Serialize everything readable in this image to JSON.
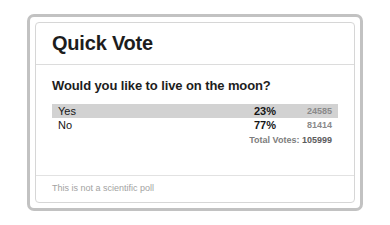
{
  "card": {
    "title": "Quick Vote",
    "question": "Would you like to live on the moon?",
    "disclaimer": "This is not a scientific poll"
  },
  "results": {
    "options": [
      {
        "label": "Yes",
        "percent": "23%",
        "count": "24585",
        "leading": true
      },
      {
        "label": "No",
        "percent": "77%",
        "count": "81414",
        "leading": false
      }
    ],
    "total_label": "Total Votes:",
    "total_value": "105999"
  },
  "colors": {
    "frame_border": "#c2c2c2",
    "card_border": "#d6d6d6",
    "highlight_bar": "#d2d2d2",
    "title_text": "#1d1d1d",
    "count_text": "#8a8a8a",
    "disclaimer_text": "#a2a2a2"
  }
}
